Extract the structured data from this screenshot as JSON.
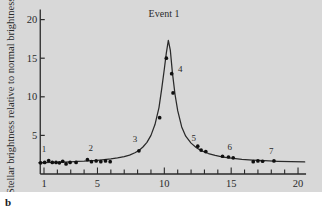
{
  "figure": {
    "panel_letter": "b",
    "background_color": "#d8d8d8",
    "ink_color": "#2a2a2a"
  },
  "chart_data": {
    "type": "line",
    "title": "Event 1",
    "xlabel": "Days",
    "ylabel": "Stellar brightness relative to normal brightness",
    "xlim": [
      0.5,
      20.6
    ],
    "ylim": [
      0,
      21.5
    ],
    "xticks_major": [
      1,
      5,
      10,
      15,
      20
    ],
    "xticks_minor_step": 1,
    "yticks": [
      5,
      10,
      15,
      20
    ],
    "grid": false,
    "legend": false,
    "series": [
      {
        "name": "light curve (fitted microlensing model)",
        "kind": "line",
        "x": [
          0.6,
          1.0,
          1.5,
          2.0,
          2.5,
          3.0,
          3.5,
          4.0,
          4.5,
          5.0,
          5.5,
          6.0,
          6.5,
          7.0,
          7.4,
          7.8,
          8.1,
          8.4,
          8.7,
          9.0,
          9.3,
          9.6,
          9.8,
          10.0,
          10.15,
          10.3,
          10.45,
          10.6,
          10.8,
          11.0,
          11.3,
          11.6,
          12.0,
          12.4,
          12.8,
          13.3,
          13.8,
          14.4,
          15.0,
          15.8,
          16.6,
          17.5,
          18.5,
          19.5,
          20.5
        ],
        "y": [
          1.45,
          1.47,
          1.5,
          1.52,
          1.55,
          1.58,
          1.62,
          1.66,
          1.72,
          1.78,
          1.86,
          1.95,
          2.08,
          2.25,
          2.45,
          2.75,
          3.05,
          3.5,
          4.1,
          5.0,
          6.4,
          8.6,
          11.0,
          13.6,
          15.7,
          17.3,
          16.0,
          13.2,
          10.3,
          8.2,
          6.1,
          4.9,
          4.0,
          3.4,
          3.0,
          2.65,
          2.4,
          2.2,
          2.05,
          1.9,
          1.8,
          1.72,
          1.65,
          1.6,
          1.56
        ]
      },
      {
        "name": "observed measurements",
        "kind": "scatter",
        "marker": "filled-circle",
        "x": [
          0.75,
          1.05,
          1.35,
          1.62,
          1.9,
          2.15,
          2.4,
          2.65,
          2.95,
          3.4,
          4.25,
          4.55,
          4.9,
          5.25,
          5.6,
          5.95,
          8.1,
          9.65,
          10.15,
          10.55,
          10.65,
          12.5,
          12.75,
          13.1,
          14.35,
          14.8,
          15.15,
          16.65,
          17.0,
          17.35,
          18.2
        ],
        "y": [
          1.45,
          1.5,
          1.75,
          1.5,
          1.5,
          1.45,
          1.65,
          1.3,
          1.5,
          1.5,
          1.85,
          1.6,
          1.7,
          1.6,
          1.7,
          1.6,
          3.0,
          7.3,
          15.0,
          13.0,
          10.5,
          3.6,
          3.1,
          2.9,
          2.3,
          2.2,
          2.1,
          1.6,
          1.7,
          1.65,
          1.7
        ]
      }
    ],
    "annotations": [
      {
        "label": "1",
        "x": 1.0,
        "y": 2.9
      },
      {
        "label": "2",
        "x": 4.5,
        "y": 3.0
      },
      {
        "label": "3",
        "x": 7.8,
        "y": 4.2
      },
      {
        "label": "4",
        "x": 11.2,
        "y": 13.2
      },
      {
        "label": "5",
        "x": 12.2,
        "y": 4.3
      },
      {
        "label": "6",
        "x": 14.9,
        "y": 3.1
      },
      {
        "label": "7",
        "x": 18.0,
        "y": 2.6
      }
    ]
  }
}
